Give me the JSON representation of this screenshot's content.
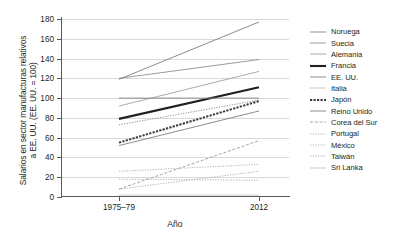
{
  "chart_data": {
    "type": "line",
    "title": "",
    "xlabel": "Año",
    "ylabel": "Salarios en sector manufacturas relativos\na EE. UU. (EE. UU. = 100)",
    "x": [
      "1975–79",
      "2012"
    ],
    "categories": [
      "1975–79",
      "2012"
    ],
    "xtick_labels": [
      "1975–79",
      "2012"
    ],
    "ytick_labels": [
      "0",
      "20",
      "40",
      "60",
      "80",
      "100",
      "120",
      "140",
      "160",
      "180"
    ],
    "ytick_values": [
      0,
      20,
      40,
      60,
      80,
      100,
      120,
      140,
      160,
      180
    ],
    "ylim": [
      0,
      180
    ],
    "grid": "horizontal",
    "legend_position": "right",
    "series": [
      {
        "name": "Noruega",
        "values": [
          119,
          177
        ],
        "style": "solid",
        "width": 0.8,
        "color": "#6d6e71"
      },
      {
        "name": "Suecia",
        "values": [
          120,
          139
        ],
        "style": "solid",
        "width": 0.8,
        "color": "#808285"
      },
      {
        "name": "Alemania",
        "values": [
          92,
          127
        ],
        "style": "solid",
        "width": 0.8,
        "color": "#939598"
      },
      {
        "name": "Francia",
        "values": [
          79,
          111
        ],
        "style": "solid",
        "width": 2.1,
        "color": "#231f20"
      },
      {
        "name": "EE. UU.",
        "values": [
          100,
          100
        ],
        "style": "solid",
        "width": 0.9,
        "color": "#808285"
      },
      {
        "name": "Italia",
        "values": [
          73,
          98
        ],
        "style": "dotted",
        "width": 0.9,
        "color": "#808285"
      },
      {
        "name": "Japón",
        "values": [
          55,
          97
        ],
        "style": "dotted",
        "width": 2.0,
        "color": "#3a3a3c"
      },
      {
        "name": "Reino Unido",
        "values": [
          52,
          87
        ],
        "style": "solid",
        "width": 0.8,
        "color": "#6d6e71"
      },
      {
        "name": "Corea del Sur",
        "values": [
          8,
          57
        ],
        "style": "dashed",
        "width": 0.9,
        "color": "#9a9a9d"
      },
      {
        "name": "Portugal",
        "values": [
          26,
          33
        ],
        "style": "dotted",
        "width": 0.9,
        "color": "#a7a9ac"
      },
      {
        "name": "México",
        "values": [
          18,
          17
        ],
        "style": "dotted",
        "width": 0.9,
        "color": "#a7a9ac"
      },
      {
        "name": "Taiwán",
        "values": [
          8,
          26
        ],
        "style": "dotted",
        "width": 0.9,
        "color": "#a7a9ac"
      },
      {
        "name": "Sri Lanka",
        "values": [
          2,
          2
        ],
        "style": "solid",
        "width": 0.8,
        "color": "#bcbec0"
      }
    ]
  },
  "legend": {
    "items": [
      {
        "label": "Noruega"
      },
      {
        "label": "Suecia"
      },
      {
        "label": "Alemania"
      },
      {
        "label": "Francia"
      },
      {
        "label": "EE. UU."
      },
      {
        "label": "Italia"
      },
      {
        "label": "Japón"
      },
      {
        "label": "Reino Unido"
      },
      {
        "label": "Corea del Sur"
      },
      {
        "label": "Portugal"
      },
      {
        "label": "México"
      },
      {
        "label": "Taiwán"
      },
      {
        "label": "Sri Lanka"
      }
    ]
  }
}
